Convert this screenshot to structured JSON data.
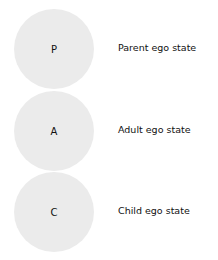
{
  "diagram": {
    "states": [
      {
        "letter": "P",
        "label": "Parent ego state"
      },
      {
        "letter": "A",
        "label": "Adult ego state"
      },
      {
        "letter": "C",
        "label": "Child ego state"
      }
    ],
    "circle_color": "#ebebeb"
  }
}
